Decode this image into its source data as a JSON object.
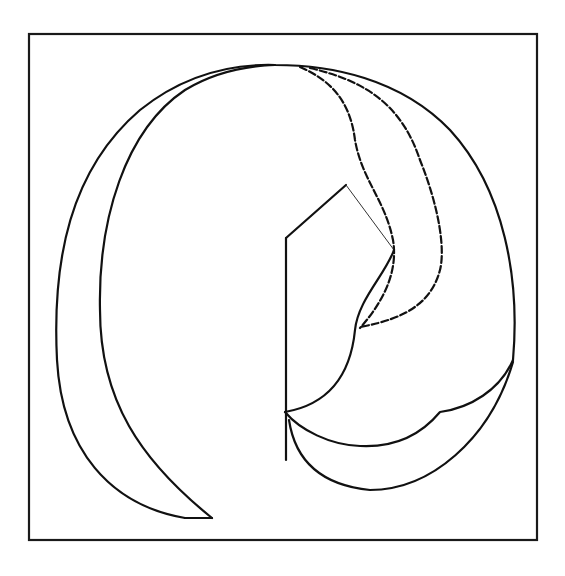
{
  "diagram": {
    "colors": {
      "background": "#ffffff",
      "stroke": "#111111"
    },
    "frame": {
      "x": 29,
      "y": 34,
      "width": 508,
      "height": 506
    },
    "paths": [
      {
        "id": "outer-outline",
        "style": "solid",
        "d": "M 185 518 C 110 505 62 450 57 360 C 52 260 70 170 140 110 C 190 70 240 64 275 65 C 330 65 400 78 450 130 C 505 190 520 280 513 360"
      },
      {
        "id": "inner-left-curve",
        "style": "solid",
        "d": "M 212 518 C 140 460 100 400 100 310 C 98 220 125 130 185 90 C 215 72 245 66 275 65"
      },
      {
        "id": "dashed-inner",
        "style": "dashed",
        "d": "M 300 67 C 330 80 350 100 355 140 C 362 180 385 200 393 240 C 398 270 385 300 360 328"
      },
      {
        "id": "dashed-outer",
        "style": "dashed",
        "d": "M 310 68 C 360 80 400 100 420 160 C 440 210 445 250 440 270 C 432 300 410 318 360 327"
      },
      {
        "id": "stem-vertical",
        "style": "solid",
        "d": "M 286 238 L 286 460"
      },
      {
        "id": "stem-left-roof",
        "style": "solid",
        "d": "M 286 238 L 346 185"
      },
      {
        "id": "stem-right-roof",
        "style": "thin",
        "d": "M 346 185 L 394 250"
      },
      {
        "id": "upper-lower-arc",
        "style": "solid",
        "d": "M 285 412 C 325 405 350 380 355 330 C 358 300 385 275 394 250"
      },
      {
        "id": "middle-arc",
        "style": "solid",
        "d": "M 285 412 C 300 430 330 445 360 446 C 400 448 425 430 440 412 C 470 408 500 390 513 360"
      },
      {
        "id": "bottom-arc",
        "style": "solid",
        "d": "M 289 420 C 295 460 320 485 370 490 C 430 490 490 440 513 362"
      },
      {
        "id": "bottom-tail",
        "style": "solid",
        "d": "M 185 518 L 212 518"
      }
    ]
  }
}
